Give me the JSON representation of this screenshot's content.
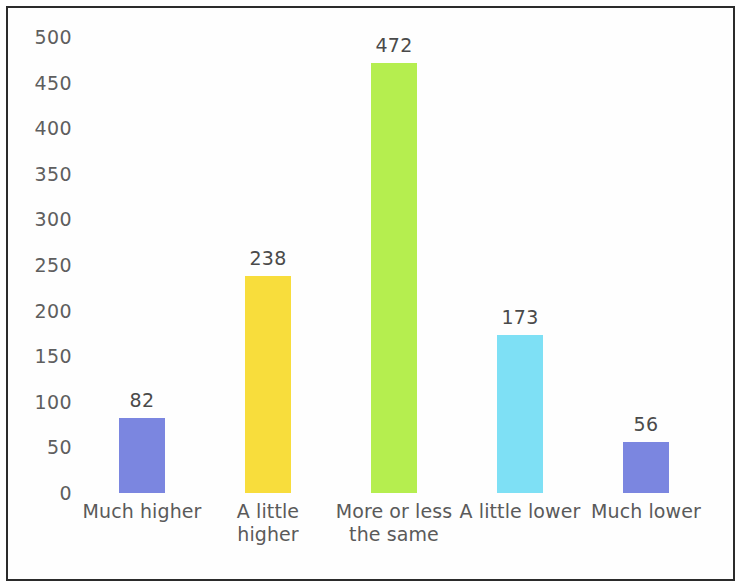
{
  "chart_data": {
    "type": "bar",
    "title": "",
    "subtitle": "",
    "xlabel": "",
    "ylabel": "",
    "categories": [
      "Much higher",
      "A little\nhigher",
      "More or less\nthe same",
      "A little lower",
      "Much lower"
    ],
    "values": [
      82,
      238,
      472,
      173,
      56
    ],
    "value_labels": [
      "82",
      "238",
      "472",
      "173",
      "56"
    ],
    "colors": [
      "#7b86e0",
      "#f8dd3c",
      "#b5ee4f",
      "#7ee0f5",
      "#7b86e0"
    ],
    "ylim": [
      0,
      500
    ],
    "ytick_step": 50,
    "ytick_labels": [
      "500",
      "450",
      "400",
      "350",
      "300",
      "250",
      "200",
      "150",
      "100",
      "50",
      "0"
    ],
    "ytick_values": [
      500,
      450,
      400,
      350,
      300,
      250,
      200,
      150,
      100,
      50,
      0
    ],
    "grid": false,
    "legend": "none",
    "axis_line": false,
    "background_color": "#ffffff",
    "border_color": "#2b2b2b",
    "text_color": "#5a5a5a"
  }
}
